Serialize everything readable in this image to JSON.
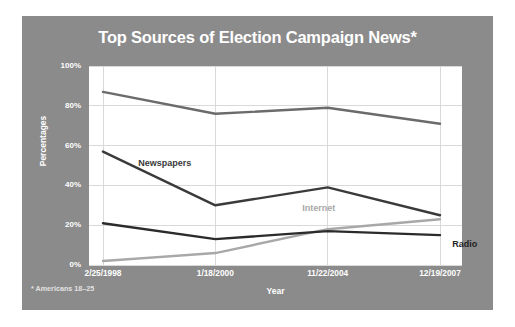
{
  "chart_data": {
    "type": "line",
    "title": "Top Sources of Election Campaign News*",
    "xlabel": "Year",
    "ylabel": "Percentages",
    "footnote": "* Americans 18–25",
    "categories": [
      "2/25/1998",
      "1/18/2000",
      "11/22/2004",
      "12/19/2007"
    ],
    "ylim": [
      0,
      100
    ],
    "ytick_labels": [
      "100%",
      "80%",
      "60%",
      "40%",
      "20%",
      "0%"
    ],
    "ytick_values": [
      100,
      80,
      60,
      40,
      20,
      0
    ],
    "grid": true,
    "legend_position": "inline-labels",
    "series": [
      {
        "name": "Television",
        "values": [
          87,
          76,
          79,
          71
        ],
        "color": "#6b6b6b",
        "label_color": "#ffffff",
        "label_x_index": 2.35,
        "label_y": 88
      },
      {
        "name": "Newspapers",
        "values": [
          57,
          30,
          39,
          25
        ],
        "color": "#3a3a3a",
        "label_color": "#3a3a3a",
        "label_x_index": 0.55,
        "label_y": 51
      },
      {
        "name": "Internet",
        "values": [
          2,
          6,
          18,
          23
        ],
        "color": "#a8a8a8",
        "label_color": "#a8a8a8",
        "label_x_index": 1.92,
        "label_y": 28
      },
      {
        "name": "Radio",
        "values": [
          21,
          13,
          17,
          15
        ],
        "color": "#2b2b2b",
        "label_color": "#1f1f1f",
        "label_x_index": 3.22,
        "label_y": 10
      }
    ]
  },
  "colors": {
    "card_background": "#8b8b8b",
    "plot_background": "#ffffff",
    "grid": "#d9d9d9",
    "title_text": "#ffffff",
    "axis_text": "#ffffff",
    "page_background": "#ffffff"
  }
}
